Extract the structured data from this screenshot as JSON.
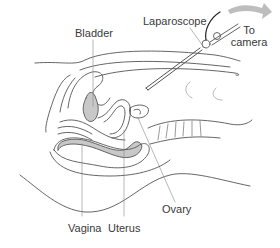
{
  "diagram": {
    "type": "anatomical-illustration",
    "labels": {
      "bladder": "Bladder",
      "laparoscope": "Laparoscope",
      "to_camera_line1": "To",
      "to_camera_line2": "camera",
      "vagina": "Vagina",
      "uterus": "Uterus",
      "ovary": "Ovary"
    },
    "colors": {
      "outline": "#555555",
      "fill_gray": "#c8c8c8",
      "arrow_gray": "#bdbdbd",
      "text": "#3a3a3a",
      "background": "#ffffff"
    }
  }
}
